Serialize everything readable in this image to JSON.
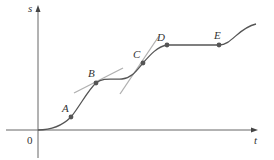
{
  "diagram": {
    "axes": {
      "x_label": "t",
      "y_label": "s",
      "origin_label": "0"
    },
    "points": [
      {
        "label": "A",
        "x": 71,
        "y": 117
      },
      {
        "label": "B",
        "x": 96,
        "y": 83
      },
      {
        "label": "C",
        "x": 143,
        "y": 63
      },
      {
        "label": "D",
        "x": 167,
        "y": 45
      },
      {
        "label": "E",
        "x": 219,
        "y": 45
      }
    ],
    "colors": {
      "curve": "#555555",
      "tangent": "#b0b0b0",
      "axis": "#666666"
    }
  }
}
